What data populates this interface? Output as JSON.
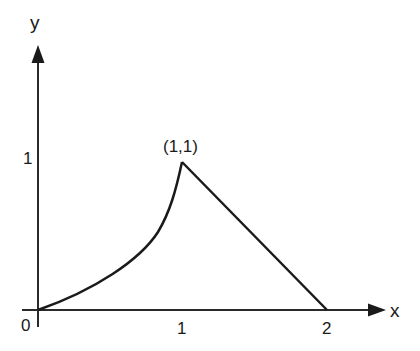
{
  "diagram": {
    "axes": {
      "x_label": "x",
      "y_label": "y",
      "origin_label": "0",
      "x_ticks": [
        "1",
        "2"
      ],
      "y_ticks": [
        "1"
      ]
    },
    "annotations": {
      "peak_label": "(1,1)"
    },
    "curve": {
      "description": "Convex increasing curve from (0,0) to (1,1), then straight line from (1,1) down to (2,0)",
      "points": [
        [
          0,
          0
        ],
        [
          1,
          1
        ],
        [
          2,
          0
        ]
      ]
    },
    "colors": {
      "line": "#1a1a1a",
      "background": "#ffffff"
    }
  }
}
